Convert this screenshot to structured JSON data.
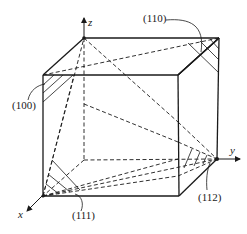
{
  "figure": {
    "type": "cubic unit cell with crystallographic planes",
    "axes": {
      "x": "x",
      "y": "y",
      "z": "z"
    },
    "plane_labels": [
      {
        "id": "p100",
        "text": "(100)"
      },
      {
        "id": "p110",
        "text": "(110)"
      },
      {
        "id": "p111",
        "text": "(111)"
      },
      {
        "id": "p112",
        "text": "(112)"
      }
    ],
    "colors": {
      "line": "#1a1a1a",
      "background": "#ffffff"
    }
  }
}
